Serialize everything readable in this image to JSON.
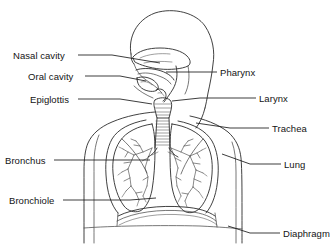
{
  "diagram": {
    "type": "anatomical-line-drawing",
    "background_color": "#ffffff",
    "line_color": "#2b2b2b",
    "text_color": "#141414",
    "width": 333,
    "height": 246
  },
  "labels": {
    "nasal_cavity": "Nasal cavity",
    "oral_cavity": "Oral cavity",
    "epiglottis": "Epiglottis",
    "bronchus": "Bronchus",
    "bronchiole": "Bronchiole",
    "pharynx": "Pharynx",
    "larynx": "Larynx",
    "trachea": "Trachea",
    "lung": "Lung",
    "diaphragm": "Diaphragm"
  },
  "label_positions": {
    "nasal_cavity": {
      "x": 13,
      "y": 50,
      "side": "left"
    },
    "oral_cavity": {
      "x": 28,
      "y": 71,
      "side": "left"
    },
    "epiglottis": {
      "x": 30,
      "y": 94,
      "side": "left"
    },
    "bronchus": {
      "x": 5,
      "y": 155,
      "side": "left"
    },
    "bronchiole": {
      "x": 9,
      "y": 195,
      "side": "left"
    },
    "pharynx": {
      "x": 220,
      "y": 67,
      "side": "right"
    },
    "larynx": {
      "x": 259,
      "y": 93,
      "side": "right"
    },
    "trachea": {
      "x": 272,
      "y": 123,
      "side": "right"
    },
    "lung": {
      "x": 284,
      "y": 159,
      "side": "right"
    },
    "diaphragm": {
      "x": 283,
      "y": 228,
      "side": "right"
    }
  },
  "leader_lines": {
    "nasal_cavity": "M 78,55 L 112,55 L 160,63",
    "oral_cavity": "M 85,76 L 120,76 L 146,81",
    "epiglottis": "M 78,99 L 120,99 L 152,104",
    "bronchus": "M 54,160 L 120,160 L 150,160",
    "bronchiole": "M 63,200 L 130,200 L 156,198",
    "pharynx": "M 217,72 L 178,72 L 166,72",
    "larynx": "M 256,98 L 200,98 L 172,101",
    "trachea": "M 269,128 L 230,128 L 196,123",
    "lung": "M 281,164 L 250,164 L 222,154",
    "diaphragm": "M 280,233 L 250,233 L 228,226"
  },
  "structures": [
    "skull-head-profile",
    "nasal-cavity-chamber",
    "oral-cavity-chamber",
    "tongue",
    "epiglottis-flap",
    "pharynx-passage",
    "larynx-cartilage",
    "trachea-with-rings",
    "left-bronchus",
    "right-bronchus",
    "left-lung",
    "right-lung",
    "bronchial-tree",
    "diaphragm-dome",
    "torso-outline",
    "shoulders",
    "arms"
  ]
}
